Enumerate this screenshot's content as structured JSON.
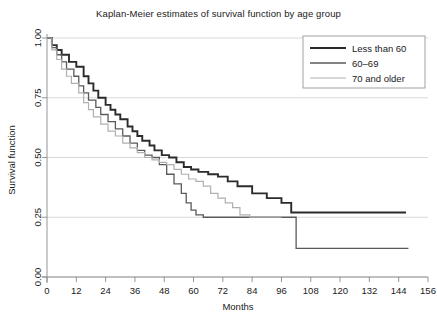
{
  "chart_data": {
    "type": "line",
    "title": "Kaplan-Meier estimates of survival function by age group",
    "xlabel": "Months",
    "ylabel": "Survival function",
    "xlim": [
      0,
      156
    ],
    "ylim": [
      0,
      1.0
    ],
    "xticks": [
      0,
      12,
      24,
      36,
      48,
      60,
      72,
      84,
      96,
      108,
      120,
      132,
      144,
      156
    ],
    "xtick_labels": [
      "0",
      "12",
      "24",
      "36",
      "48",
      "60",
      "72",
      "84",
      "96",
      "108",
      "120",
      "132",
      "144",
      "156"
    ],
    "yticks": [
      0.0,
      0.25,
      0.5,
      0.75,
      1.0
    ],
    "ytick_labels": [
      "0.00",
      "0.25",
      "0.50",
      "0.75",
      "1.00"
    ],
    "grid": "horizontal",
    "legend_position": "top-right",
    "step_type": "post",
    "series": [
      {
        "name": "Less than 60",
        "color": "#2b2b2b",
        "width": 1.9,
        "x": [
          0,
          2,
          4,
          6,
          9,
          12,
          15,
          17,
          19,
          21,
          24,
          26,
          28,
          30,
          33,
          35,
          37,
          39,
          42,
          44,
          47,
          50,
          53,
          56,
          59,
          62,
          66,
          70,
          74,
          78,
          84,
          90,
          96,
          100,
          147
        ],
        "y": [
          1.0,
          0.97,
          0.95,
          0.93,
          0.9,
          0.88,
          0.84,
          0.81,
          0.78,
          0.75,
          0.72,
          0.7,
          0.68,
          0.66,
          0.63,
          0.61,
          0.59,
          0.57,
          0.55,
          0.53,
          0.51,
          0.5,
          0.48,
          0.46,
          0.45,
          0.44,
          0.43,
          0.42,
          0.4,
          0.38,
          0.35,
          0.33,
          0.31,
          0.27,
          0.27
        ]
      },
      {
        "name": "60–69",
        "color": "#5a5a5a",
        "width": 1.3,
        "x": [
          0,
          2,
          4,
          6,
          8,
          11,
          13,
          15,
          17,
          20,
          22,
          25,
          28,
          31,
          34,
          37,
          40,
          43,
          46,
          49,
          52,
          55,
          57,
          59,
          61,
          64,
          68,
          72,
          78,
          84,
          90,
          96,
          102,
          108,
          148
        ],
        "y": [
          1.0,
          0.96,
          0.93,
          0.9,
          0.87,
          0.84,
          0.8,
          0.77,
          0.74,
          0.71,
          0.68,
          0.65,
          0.62,
          0.59,
          0.56,
          0.53,
          0.51,
          0.5,
          0.47,
          0.43,
          0.39,
          0.35,
          0.31,
          0.28,
          0.26,
          0.25,
          0.25,
          0.25,
          0.25,
          0.25,
          0.25,
          0.25,
          0.12,
          0.12,
          0.12
        ]
      },
      {
        "name": "70 and older",
        "color": "#b0b0b0",
        "width": 1.2,
        "x": [
          0,
          2,
          4,
          6,
          8,
          10,
          13,
          15,
          17,
          19,
          22,
          25,
          28,
          31,
          34,
          37,
          40,
          43,
          46,
          49,
          52,
          55,
          58,
          61,
          64,
          67,
          70,
          73,
          76,
          79,
          83,
          96
        ],
        "y": [
          1.0,
          0.95,
          0.91,
          0.87,
          0.84,
          0.81,
          0.77,
          0.73,
          0.7,
          0.67,
          0.64,
          0.61,
          0.59,
          0.56,
          0.54,
          0.52,
          0.5,
          0.49,
          0.48,
          0.47,
          0.45,
          0.43,
          0.41,
          0.4,
          0.38,
          0.35,
          0.33,
          0.31,
          0.29,
          0.26,
          0.25,
          0.25
        ]
      }
    ]
  }
}
